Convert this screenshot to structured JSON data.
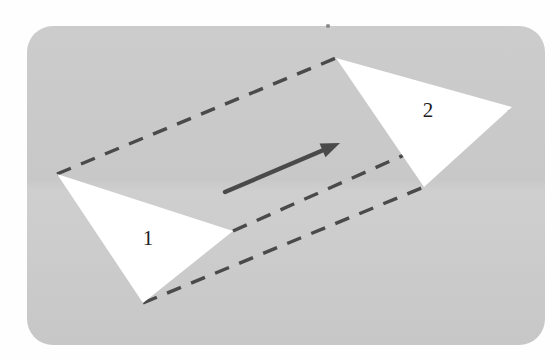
{
  "figure": {
    "name": "triangle-translation-diagram",
    "canvas": {
      "width": 559,
      "height": 361,
      "background": "#fefefe"
    },
    "panel": {
      "name": "rounded-gray-panel",
      "x": 27,
      "y": 26,
      "width": 518,
      "height": 319,
      "corner_radius": 26,
      "fill": "#c9c9c9"
    },
    "triangles": [
      {
        "label": "1",
        "name": "triangle-one",
        "fill": "#ffffff",
        "points": "57,174 233,231 143,303",
        "label_x": 148,
        "label_y": 240
      },
      {
        "label": "2",
        "name": "triangle-two",
        "fill": "#ffffff",
        "points": "336,58 512,107 424,187",
        "label_x": 428,
        "label_y": 112
      }
    ],
    "translation_lines": [
      {
        "name": "translation-line-top",
        "x1": 57,
        "y1": 174,
        "x2": 336,
        "y2": 58
      },
      {
        "name": "translation-line-middle",
        "x1": 233,
        "y1": 231,
        "x2": 512,
        "y2": 107
      },
      {
        "name": "translation-line-bottom",
        "x1": 143,
        "y1": 303,
        "x2": 424,
        "y2": 187
      }
    ],
    "dash_style": {
      "color": "#4a4a4a",
      "width": 3.4,
      "dasharray": "15 11"
    },
    "arrow": {
      "name": "translation-vector-arrow",
      "x1": 225,
      "y1": 192,
      "x2": 340,
      "y2": 143,
      "color": "#4a4a4a",
      "width": 4.4,
      "head_length": 19,
      "head_width": 15
    },
    "speck": {
      "name": "scan-speck",
      "cx": 328,
      "cy": 26,
      "r": 2.1,
      "fill": "#8a8a8a"
    }
  }
}
